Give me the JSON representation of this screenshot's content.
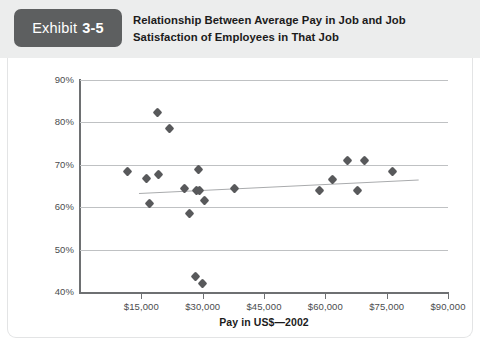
{
  "header": {
    "exhibit_word": "Exhibit",
    "exhibit_number": "3-5",
    "title_line1": "Relationship Between Average Pay in Job and Job",
    "title_line2": "Satisfaction of Employees in That Job",
    "tag_color": "#5d5f60",
    "band_color": "#eceded"
  },
  "chart_data": {
    "type": "scatter",
    "title": "Relationship Between Average Pay in Job and Job Satisfaction of Employees in That Job",
    "xlabel": "Pay in US$—2002",
    "ylabel": "Percentage of Pay Satisfaction",
    "xlim": [
      0,
      90000
    ],
    "ylim": [
      40,
      90
    ],
    "grid": true,
    "legend": "none",
    "marker": "diamond",
    "marker_color": "#58595b",
    "xticks": [
      15000,
      30000,
      45000,
      60000,
      75000,
      90000
    ],
    "xtick_labels": [
      "$15,000",
      "$30,000",
      "$45,000",
      "$60,000",
      "$75,000",
      "$90,000"
    ],
    "yticks": [
      40,
      50,
      60,
      70,
      80,
      90
    ],
    "ytick_labels": [
      "40%",
      "50%",
      "60%",
      "70%",
      "80%",
      "90%"
    ],
    "points": [
      {
        "x": 11700,
        "y": 68.4
      },
      {
        "x": 16200,
        "y": 66.8
      },
      {
        "x": 19000,
        "y": 82.4
      },
      {
        "x": 19100,
        "y": 67.6
      },
      {
        "x": 17000,
        "y": 60.8
      },
      {
        "x": 22000,
        "y": 78.6
      },
      {
        "x": 25500,
        "y": 64.3
      },
      {
        "x": 26800,
        "y": 58.6
      },
      {
        "x": 28500,
        "y": 64.0
      },
      {
        "x": 29300,
        "y": 64.0
      },
      {
        "x": 29000,
        "y": 69.0
      },
      {
        "x": 28200,
        "y": 43.6
      },
      {
        "x": 30000,
        "y": 42.0
      },
      {
        "x": 30500,
        "y": 61.5
      },
      {
        "x": 37800,
        "y": 64.5
      },
      {
        "x": 58500,
        "y": 64.0
      },
      {
        "x": 61800,
        "y": 66.6
      },
      {
        "x": 65500,
        "y": 71.0
      },
      {
        "x": 67800,
        "y": 64.0
      },
      {
        "x": 69500,
        "y": 71.0
      },
      {
        "x": 76500,
        "y": 68.4
      }
    ],
    "trendline": {
      "x_start": 14500,
      "y_start": 63.3,
      "x_end": 83000,
      "y_end": 66.5,
      "color": "#a9abad"
    }
  }
}
